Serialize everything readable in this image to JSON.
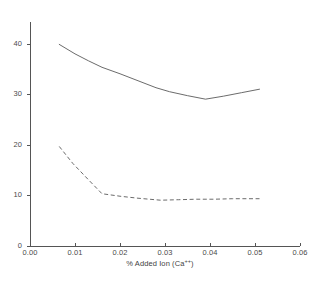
{
  "chart_data": {
    "type": "line",
    "title": "",
    "xlabel": "% Added Ion (Ca++)",
    "ylabel": "",
    "xlim": [
      0.0,
      0.06
    ],
    "ylim": [
      0,
      45
    ],
    "grid": false,
    "legend": false,
    "background_color": "#ffffff",
    "line_color": "#555555",
    "axis_color": "#555555",
    "xticks": [
      0.0,
      0.01,
      0.02,
      0.03,
      0.04,
      0.05,
      0.06
    ],
    "xtick_labels": [
      "0.00",
      "0.01",
      "0.02",
      "0.03",
      "0.04",
      "0.05",
      "0.06"
    ],
    "yticks": [
      0,
      10,
      20,
      30,
      40
    ],
    "ytick_labels": [
      "0",
      "10",
      "20",
      "30",
      "40"
    ],
    "series": [
      {
        "name": "upper-curve",
        "style": "solid",
        "x": [
          0.0065,
          0.01,
          0.013,
          0.016,
          0.02,
          0.024,
          0.028,
          0.031,
          0.035,
          0.039,
          0.043,
          0.047,
          0.051
        ],
        "values": [
          40.5,
          38.6,
          37.2,
          35.9,
          34.6,
          33.2,
          31.8,
          31.0,
          30.2,
          29.5,
          30.1,
          30.8,
          31.5
        ]
      },
      {
        "name": "lower-curve",
        "style": "dashed",
        "x": [
          0.0065,
          0.0095,
          0.013,
          0.016,
          0.02,
          0.024,
          0.029,
          0.033,
          0.037,
          0.041,
          0.045,
          0.048,
          0.051
        ],
        "values": [
          20.0,
          16.6,
          13.3,
          10.5,
          10.0,
          9.6,
          9.2,
          9.3,
          9.4,
          9.4,
          9.5,
          9.5,
          9.5
        ]
      }
    ]
  },
  "axes_geometry": {
    "left_px": 30,
    "right_px": 300,
    "bottom_px": 246,
    "top_px": 22
  },
  "x_tick_labels": {
    "t0": "0.00",
    "t1": "0.01",
    "t2": "0.02",
    "t3": "0.03",
    "t4": "0.04",
    "t5": "0.05",
    "t6": "0.06"
  },
  "y_tick_labels": {
    "t0": "0",
    "t10": "10",
    "t20": "20",
    "t30": "30",
    "t40": "40"
  },
  "x_axis_title": {
    "prefix": "% Added Ion (Ca",
    "superscript": "++",
    "suffix": ")"
  }
}
